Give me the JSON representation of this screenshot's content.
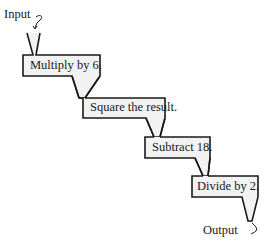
{
  "diagram": {
    "type": "function-machine-flow",
    "input_label": "Input",
    "output_label": "Output",
    "steps": [
      {
        "label": "Multiply by 6."
      },
      {
        "label": "Square the result."
      },
      {
        "label": "Subtract 18."
      },
      {
        "label": "Divide by 2."
      }
    ],
    "colors": {
      "box_fill": "#f2f2f2",
      "stroke": "#1a1a1a",
      "background": "#ffffff"
    }
  }
}
